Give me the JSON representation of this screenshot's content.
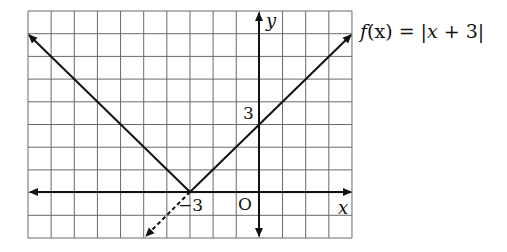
{
  "function_label": {
    "prefix": "f",
    "arg": "(x)",
    "eq": " = |",
    "body_var": "x",
    "body_rest": " + 3|"
  },
  "axes": {
    "x_label": "x",
    "y_label": "y",
    "origin_label": "O"
  },
  "ticks": {
    "y_intercept": "3",
    "x_intercept": "−3"
  },
  "grid": {
    "x_min": -10,
    "x_max": 4,
    "y_min": -2,
    "y_max": 8,
    "cell_px": 23.1,
    "color": "#555555"
  },
  "graph": {
    "vertex": [
      -3,
      0
    ],
    "y_intercept": [
      0,
      3
    ],
    "line_color": "#111111"
  }
}
